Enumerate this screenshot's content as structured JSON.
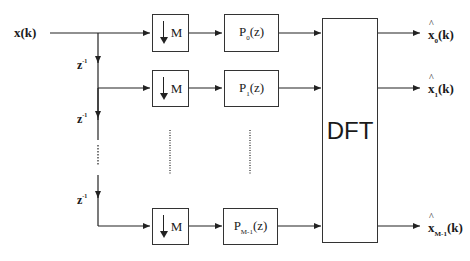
{
  "diagram": {
    "type": "polyphase DFT filter bank block diagram",
    "input": {
      "label": "x(k)"
    },
    "delays": [
      {
        "label": "z",
        "exponent": "-1"
      },
      {
        "label": "z",
        "exponent": "-1"
      },
      {
        "label": "z",
        "exponent": "-1"
      }
    ],
    "decimators": [
      {
        "label": "M"
      },
      {
        "label": "M"
      },
      {
        "label": "M"
      }
    ],
    "filters": [
      {
        "base": "P",
        "sub": "0",
        "suffix": "(z)"
      },
      {
        "base": "P",
        "sub": "1",
        "suffix": "(z)"
      },
      {
        "base": "P",
        "sub": "M-1",
        "suffix": "(z)"
      }
    ],
    "transform": {
      "label": "DFT"
    },
    "outputs": [
      {
        "base": "x",
        "sub": "0",
        "suffix": "(k)"
      },
      {
        "base": "x",
        "sub": "1",
        "suffix": "(k)"
      },
      {
        "base": "x",
        "sub": "M-1",
        "suffix": "(k)"
      }
    ],
    "colors": {
      "line": "#222222",
      "background": "#ffffff"
    }
  }
}
